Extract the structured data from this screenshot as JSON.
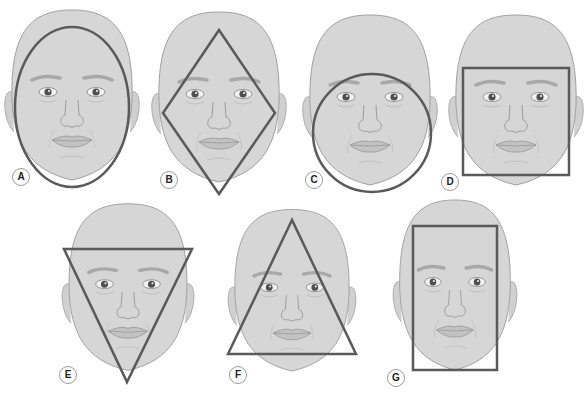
{
  "colors": {
    "skin": "#d4d4d4",
    "skin_outline": "#9e9e9e",
    "overlay": "#5a5a5a",
    "brow": "#a9a9a9",
    "background": "#ffffff"
  },
  "faces": [
    {
      "label": "A",
      "shape": "oval"
    },
    {
      "label": "B",
      "shape": "diamond"
    },
    {
      "label": "C",
      "shape": "round"
    },
    {
      "label": "D",
      "shape": "square"
    },
    {
      "label": "E",
      "shape": "inverted-triangle"
    },
    {
      "label": "F",
      "shape": "triangle"
    },
    {
      "label": "G",
      "shape": "rectangle"
    }
  ]
}
